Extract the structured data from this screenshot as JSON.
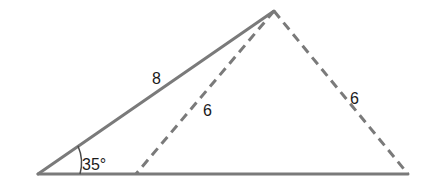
{
  "diagram": {
    "type": "triangle-ambiguous-case",
    "colors": {
      "line": "#7a7a7a",
      "text": "#1a1a1a",
      "background": "#ffffff"
    },
    "vertices": {
      "A": [
        38,
        174
      ],
      "B": [
        274,
        11
      ],
      "C1": [
        136,
        174
      ],
      "C2": [
        408,
        174
      ]
    },
    "labels": {
      "side_AB": "8",
      "side_BC1": "6",
      "side_BC2": "6",
      "angle_A": "35°"
    }
  }
}
